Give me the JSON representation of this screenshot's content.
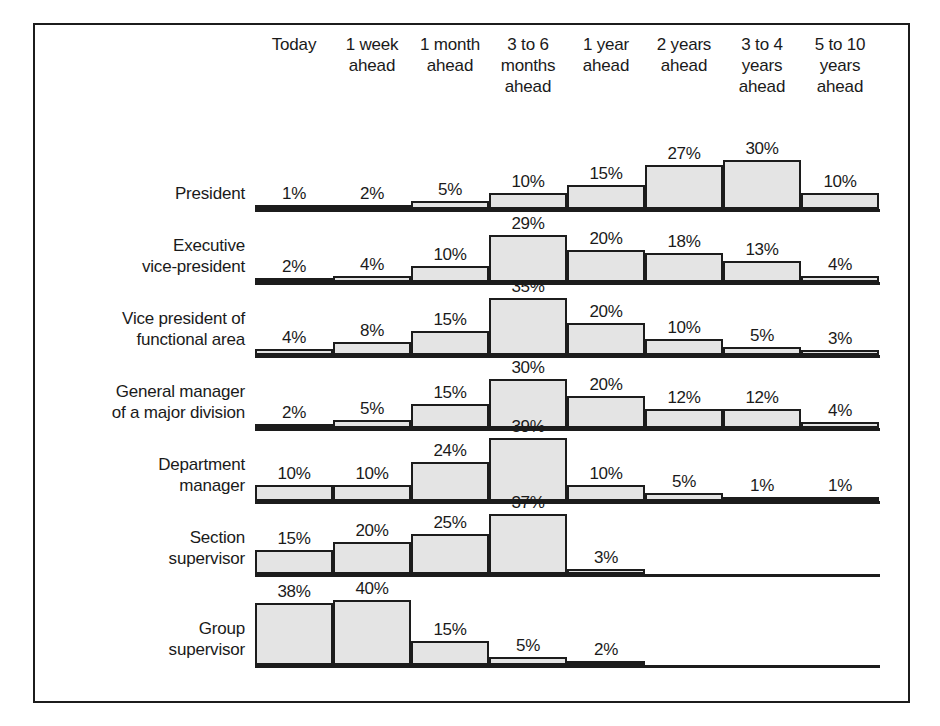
{
  "chart_data": {
    "type": "bar",
    "title": "",
    "subtitle": "",
    "xlabel": "",
    "ylabel": "",
    "grid": false,
    "legend_position": "none",
    "value_suffix": "%",
    "ylim": [
      0,
      40
    ],
    "categories": [
      "Today",
      "1 week ahead",
      "1 month ahead",
      "3 to 6 months ahead",
      "1 year ahead",
      "2 years ahead",
      "3 to 4 years ahead",
      "5 to 10 years ahead"
    ],
    "category_lines": [
      [
        "Today"
      ],
      [
        "1 week",
        "ahead"
      ],
      [
        "1 month",
        "ahead"
      ],
      [
        "3 to 6",
        "months",
        "ahead"
      ],
      [
        "1 year",
        "ahead"
      ],
      [
        "2 years",
        "ahead"
      ],
      [
        "3 to 4",
        "years",
        "ahead"
      ],
      [
        "5 to 10",
        "years",
        "ahead"
      ]
    ],
    "series": [
      {
        "name": "President",
        "name_lines": [
          "President"
        ],
        "values": [
          1,
          2,
          5,
          10,
          15,
          27,
          30,
          10
        ],
        "labels": [
          "1%",
          "2%",
          "5%",
          "10%",
          "15%",
          "27%",
          "30%",
          "10%"
        ]
      },
      {
        "name": "Executive vice-president",
        "name_lines": [
          "Executive",
          "vice-president"
        ],
        "values": [
          2,
          4,
          10,
          29,
          20,
          18,
          13,
          4
        ],
        "labels": [
          "2%",
          "4%",
          "10%",
          "29%",
          "20%",
          "18%",
          "13%",
          "4%"
        ]
      },
      {
        "name": "Vice president of functional area",
        "name_lines": [
          "Vice president of",
          "functional area"
        ],
        "values": [
          4,
          8,
          15,
          35,
          20,
          10,
          5,
          3
        ],
        "labels": [
          "4%",
          "8%",
          "15%",
          "35%",
          "20%",
          "10%",
          "5%",
          "3%"
        ]
      },
      {
        "name": "General manager of a major division",
        "name_lines": [
          "General manager",
          "of a major division"
        ],
        "values": [
          2,
          5,
          15,
          30,
          20,
          12,
          12,
          4
        ],
        "labels": [
          "2%",
          "5%",
          "15%",
          "30%",
          "20%",
          "12%",
          "12%",
          "4%"
        ]
      },
      {
        "name": "Department manager",
        "name_lines": [
          "Department",
          "manager"
        ],
        "values": [
          10,
          10,
          24,
          39,
          10,
          5,
          1,
          1
        ],
        "labels": [
          "10%",
          "10%",
          "24%",
          "39%",
          "10%",
          "5%",
          "1%",
          "1%"
        ]
      },
      {
        "name": "Section supervisor",
        "name_lines": [
          "Section",
          "supervisor"
        ],
        "values": [
          15,
          20,
          25,
          37,
          3,
          0,
          0,
          0
        ],
        "labels": [
          "15%",
          "20%",
          "25%",
          "37%",
          "3%",
          "",
          "",
          ""
        ]
      },
      {
        "name": "Group supervisor",
        "name_lines": [
          "Group",
          "supervisor"
        ],
        "values": [
          38,
          40,
          15,
          5,
          2,
          0,
          0,
          0
        ],
        "labels": [
          "38%",
          "40%",
          "15%",
          "5%",
          "2%",
          "",
          "",
          ""
        ]
      }
    ]
  },
  "colors": {
    "bar_fill": "#e4e4e4",
    "bar_stroke": "#1c1c1c",
    "frame": "#1c1c1c",
    "text": "#1a1a1a",
    "background": "#ffffff"
  }
}
